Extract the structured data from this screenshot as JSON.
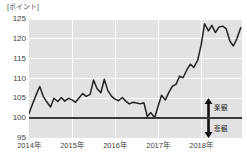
{
  "unit_caption": "[ポイント]",
  "annotations": {
    "optimistic": {
      "label": "楽観",
      "icon": "arrow-up-icon"
    },
    "pessimistic": {
      "label": "悲観",
      "icon": "arrow-down-icon"
    }
  },
  "colors": {
    "plot_background": "#e2e2e2",
    "gridline": "#ffffff",
    "baseline": "#3a3a3a",
    "series_line": "#222222",
    "tick_text": "#444444",
    "page_background": "#ffffff"
  },
  "chart_data": {
    "type": "line",
    "title": "",
    "subtitle": "",
    "xlabel": "",
    "ylabel": "[ポイント]",
    "ylim": [
      95,
      125
    ],
    "yticks": [
      95,
      100,
      105,
      110,
      115,
      120,
      125
    ],
    "ytick_labels": [
      "95",
      "100",
      "105",
      "110",
      "115",
      "120",
      "125"
    ],
    "xlim": [
      2014.0,
      2018.95
    ],
    "xticks": [
      2014,
      2015,
      2016,
      2017,
      2018
    ],
    "xtick_labels": [
      "2014年",
      "2015年",
      "2016年",
      "2017年",
      "2018年"
    ],
    "grid": true,
    "legend": false,
    "reference_line": {
      "value": 100,
      "style": "solid",
      "color": "#3a3a3a"
    },
    "series": [
      {
        "name": "景況感指数",
        "color": "#222222",
        "x": [
          2014.0,
          2014.08,
          2014.17,
          2014.25,
          2014.33,
          2014.42,
          2014.5,
          2014.58,
          2014.67,
          2014.75,
          2014.83,
          2014.92,
          2015.0,
          2015.08,
          2015.17,
          2015.25,
          2015.33,
          2015.42,
          2015.5,
          2015.58,
          2015.67,
          2015.75,
          2015.83,
          2015.92,
          2016.0,
          2016.08,
          2016.17,
          2016.25,
          2016.33,
          2016.42,
          2016.5,
          2016.58,
          2016.67,
          2016.75,
          2016.83,
          2016.92,
          2017.0,
          2017.08,
          2017.17,
          2017.25,
          2017.33,
          2017.42,
          2017.5,
          2017.58,
          2017.67,
          2017.75,
          2017.83,
          2017.92,
          2018.0,
          2018.08,
          2018.17,
          2018.25,
          2018.33,
          2018.42,
          2018.5,
          2018.58,
          2018.67,
          2018.75,
          2018.83,
          2018.92
        ],
        "values": [
          101.2,
          103.5,
          106.0,
          108.0,
          105.5,
          104.0,
          102.8,
          105.0,
          104.2,
          105.2,
          104.3,
          105.0,
          104.6,
          104.0,
          105.2,
          106.2,
          105.5,
          106.0,
          109.6,
          107.5,
          106.4,
          109.8,
          107.0,
          105.5,
          104.8,
          104.4,
          105.2,
          104.3,
          103.6,
          104.0,
          103.8,
          103.6,
          103.9,
          100.4,
          101.4,
          100.1,
          103.0,
          105.8,
          104.6,
          106.5,
          108.0,
          108.6,
          110.6,
          110.2,
          112.2,
          113.6,
          112.8,
          114.6,
          118.4,
          123.8,
          122.0,
          123.4,
          121.6,
          123.0,
          123.2,
          122.6,
          119.4,
          118.2,
          120.0,
          122.8
        ]
      }
    ]
  }
}
